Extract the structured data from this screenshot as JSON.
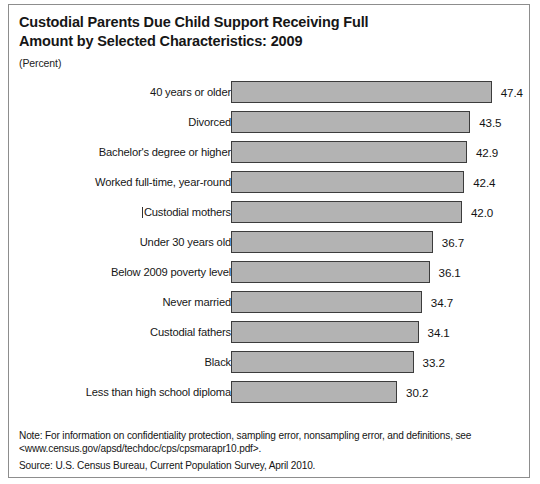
{
  "chart_data": {
    "type": "bar",
    "orientation": "horizontal",
    "title": "Custodial Parents Due Child Support Receiving Full\nAmount by Selected Characteristics: 2009",
    "subtitle": "(Percent)",
    "xlabel": "",
    "ylabel": "",
    "units": "Percent",
    "xlim": [
      0,
      50
    ],
    "grid": false,
    "legend": false,
    "categories": [
      "40 years or older",
      "Divorced",
      "Bachelor's degree or higher",
      "Worked full-time, year-round",
      "Custodial mothers",
      "Under 30 years old",
      "Below 2009 poverty level",
      "Never married",
      "Custodial fathers",
      "Black",
      "Less than high school diploma"
    ],
    "values": [
      47.4,
      43.5,
      42.9,
      42.4,
      42.0,
      36.7,
      36.1,
      34.7,
      34.1,
      33.2,
      30.2
    ],
    "value_labels": [
      "47.4",
      "43.5",
      "42.9",
      "42.4",
      "42.0",
      "36.7",
      "36.1",
      "34.7",
      "34.1",
      "33.2",
      "30.2"
    ],
    "bar_fill_color": "#b3b3b3",
    "bar_border_color": "#3c3c3c"
  },
  "footnotes": {
    "note": "Note: For information on confidentiality protection, sampling error, nonsampling error, and definitions, see <www.census.gov/apsd/techdoc/cps/cpsmarapr10.pdf>.",
    "source": "Source: U.S. Census Bureau, Current Population Survey, April 2010."
  }
}
